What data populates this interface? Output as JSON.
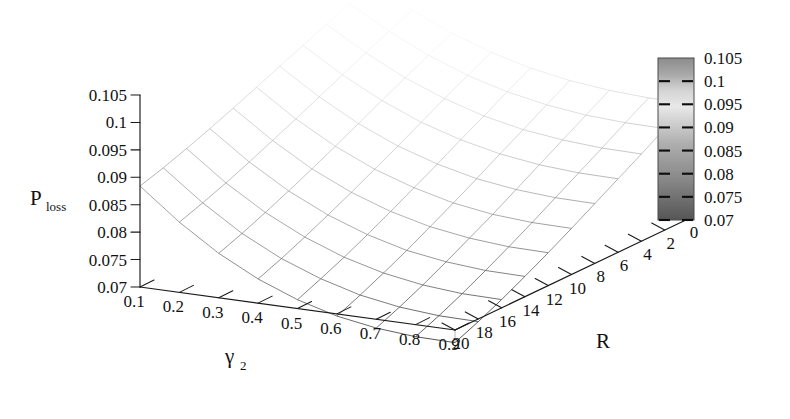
{
  "figure": {
    "kind": "3d-surface-mesh-plot",
    "background_color": "#ffffff",
    "line_color": "#1a1a1a"
  },
  "chart_data": {
    "type": "line",
    "render_style": "3d-wireframe-surface",
    "title": "",
    "subtitle": "",
    "xlabel": "γ",
    "xlabel_sub": "2",
    "ylabel": "R",
    "zlabel": "P",
    "zlabel_sub": "loss",
    "grid": false,
    "legend_position": "right",
    "xlim": [
      0.1,
      0.9
    ],
    "ylim": [
      0,
      20
    ],
    "zlim": [
      0.07,
      0.105
    ],
    "x_tick_labels": [
      "0.1",
      "0.2",
      "0.3",
      "0.4",
      "0.5",
      "0.6",
      "0.7",
      "0.8",
      "0.9"
    ],
    "x_tick_values": [
      0.1,
      0.2,
      0.3,
      0.4,
      0.5,
      0.6,
      0.7,
      0.8,
      0.9
    ],
    "y_tick_labels": [
      "20",
      "18",
      "16",
      "14",
      "12",
      "10",
      "8",
      "6",
      "4",
      "2",
      "0"
    ],
    "y_tick_values": [
      20,
      18,
      16,
      14,
      12,
      10,
      8,
      6,
      4,
      2,
      0
    ],
    "z_tick_labels": [
      "0.105",
      "0.1",
      "0.095",
      "0.09",
      "0.085",
      "0.08",
      "0.075",
      "0.07"
    ],
    "z_tick_values": [
      0.105,
      0.1,
      0.095,
      0.09,
      0.085,
      0.08,
      0.075,
      0.07
    ],
    "colorbar": {
      "labels": [
        "0.105",
        "0.1",
        "0.095",
        "0.09",
        "0.085",
        "0.08",
        "0.075",
        "0.07"
      ],
      "values": [
        0.105,
        0.1,
        0.095,
        0.09,
        0.085,
        0.08,
        0.075,
        0.07
      ],
      "colormap": "grayscale",
      "min": 0.07,
      "max": 0.105
    },
    "x": [
      0.1,
      0.2,
      0.3,
      0.4,
      0.5,
      0.6,
      0.7,
      0.8,
      0.9
    ],
    "y": [
      0,
      2,
      4,
      6,
      8,
      10,
      12,
      14,
      16,
      18,
      20
    ],
    "series": [
      {
        "name": "R=0",
        "values": [
          0.105,
          0.1012,
          0.098,
          0.0955,
          0.0936,
          0.0923,
          0.0915,
          0.0911,
          0.091
        ]
      },
      {
        "name": "R=2",
        "values": [
          0.1034,
          0.0994,
          0.096,
          0.0933,
          0.0913,
          0.0899,
          0.089,
          0.0886,
          0.0885
        ]
      },
      {
        "name": "R=4",
        "values": [
          0.1017,
          0.0975,
          0.0939,
          0.0911,
          0.0889,
          0.0874,
          0.0865,
          0.086,
          0.0859
        ]
      },
      {
        "name": "R=6",
        "values": [
          0.0999,
          0.0955,
          0.0918,
          0.0888,
          0.0866,
          0.085,
          0.084,
          0.0835,
          0.0834
        ]
      },
      {
        "name": "R=8",
        "values": [
          0.0981,
          0.0935,
          0.0896,
          0.0865,
          0.0842,
          0.0825,
          0.0815,
          0.081,
          0.0809
        ]
      },
      {
        "name": "R=10",
        "values": [
          0.0963,
          0.0915,
          0.0875,
          0.0843,
          0.0819,
          0.0801,
          0.079,
          0.0785,
          0.0784
        ]
      },
      {
        "name": "R=12",
        "values": [
          0.0945,
          0.0896,
          0.0854,
          0.0821,
          0.0796,
          0.0778,
          0.0767,
          0.0761,
          0.076
        ]
      },
      {
        "name": "R=14",
        "values": [
          0.0928,
          0.0877,
          0.0834,
          0.08,
          0.0774,
          0.0755,
          0.0744,
          0.0738,
          0.0737
        ]
      },
      {
        "name": "R=16",
        "values": [
          0.0912,
          0.0859,
          0.0815,
          0.078,
          0.0753,
          0.0734,
          0.0722,
          0.0716,
          0.0715
        ]
      },
      {
        "name": "R=18",
        "values": [
          0.0897,
          0.0843,
          0.0797,
          0.0761,
          0.0734,
          0.0714,
          0.0702,
          0.0696,
          0.0695
        ]
      },
      {
        "name": "R=20",
        "values": [
          0.0884,
          0.0828,
          0.0781,
          0.0744,
          0.0716,
          0.0696,
          0.0684,
          0.0678,
          0.0677
        ]
      }
    ]
  }
}
